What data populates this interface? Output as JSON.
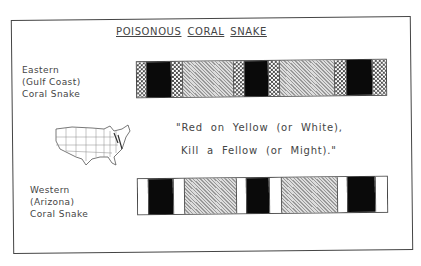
{
  "title_words": [
    "POISONOUS",
    "CORAL",
    "SNAKE"
  ],
  "eastern": {
    "label_lines": [
      "Eastern",
      "(Gulf Coast)",
      "Coral Snake"
    ],
    "bands": [
      {
        "type": "checker",
        "width": 9
      },
      {
        "type": "black",
        "width": 25
      },
      {
        "type": "checker",
        "width": 11
      },
      {
        "type": "hatched",
        "width": 51
      },
      {
        "type": "checker",
        "width": 11
      },
      {
        "type": "black",
        "width": 25
      },
      {
        "type": "checker",
        "width": 11
      },
      {
        "type": "hatched",
        "width": 55
      },
      {
        "type": "checker",
        "width": 12
      },
      {
        "type": "black",
        "width": 26
      },
      {
        "type": "checker",
        "width": 14
      }
    ]
  },
  "western": {
    "label_lines": [
      "Western",
      "(Arizona)",
      "Coral Snake"
    ],
    "bands": [
      {
        "type": "white",
        "width": 10
      },
      {
        "type": "black",
        "width": 25
      },
      {
        "type": "white",
        "width": 11
      },
      {
        "type": "hatched",
        "width": 52
      },
      {
        "type": "white",
        "width": 10
      },
      {
        "type": "black",
        "width": 24
      },
      {
        "type": "white",
        "width": 12
      },
      {
        "type": "hatched",
        "width": 56
      },
      {
        "type": "white",
        "width": 10
      },
      {
        "type": "black",
        "width": 28
      },
      {
        "type": "white",
        "width": 12
      }
    ]
  },
  "rhyme": {
    "line1": "\"Red on Yellow (or White),",
    "line2": "Kill a Fellow (or Might).\""
  },
  "map": {
    "icon": "us-map-icon",
    "description": "Outline map of the United States"
  }
}
